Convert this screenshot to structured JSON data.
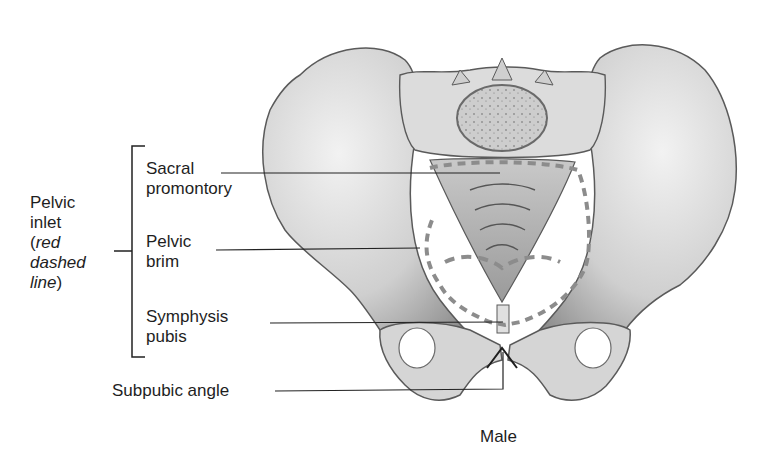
{
  "figure": {
    "caption": "Male"
  },
  "group_label": {
    "line1": "Pelvic",
    "line2": "inlet",
    "line3_prefix": "(",
    "line3_italic": "red",
    "line4_italic": "dashed",
    "line5_italic": "line",
    "line5_suffix": ")"
  },
  "labels": {
    "sacral_promontory": {
      "line1": "Sacral",
      "line2": "promontory"
    },
    "pelvic_brim": {
      "line1": "Pelvic",
      "line2": "brim"
    },
    "symphysis_pubis": {
      "line1": "Symphysis",
      "line2": "pubis"
    },
    "subpubic_angle": "Subpubic angle"
  },
  "colors": {
    "bone_light": "#e6e6e6",
    "bone_mid": "#bdbdbd",
    "bone_dark": "#8a8a8a",
    "outline": "#4a4a4a",
    "dashed_line": "#8c8c8c",
    "leader_line": "#222222"
  }
}
